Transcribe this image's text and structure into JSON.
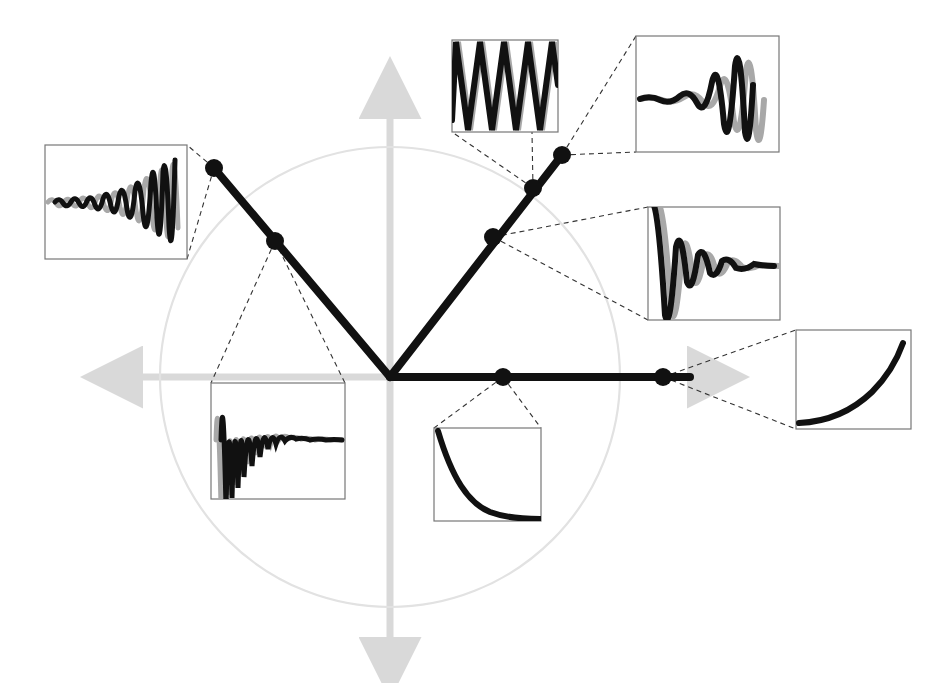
{
  "figure": {
    "width": 950,
    "height": 683,
    "background_color": "#ffffff"
  },
  "colors": {
    "axis": "#d9d9d9",
    "circle": "#e2e2e2",
    "ray": "#111111",
    "marker": "#111111",
    "leader": "#333333",
    "inset_border": "#777777",
    "curve_primary": "#111111",
    "curve_secondary": "#a8a8a8"
  },
  "geometry": {
    "origin": {
      "x": 390,
      "y": 377
    },
    "unit_circle_radius": 230,
    "axes": {
      "horizontal": {
        "x1": 128,
        "y1": 377,
        "x2": 700,
        "y2": 377,
        "arrows": "both"
      },
      "vertical": {
        "x1": 390,
        "y1": 105,
        "x2": 390,
        "y2": 650,
        "arrows": "both"
      }
    }
  },
  "chart_data": {
    "type": "scatter",
    "xlabel": "Real axis",
    "ylabel": "Imaginary axis",
    "grid": false,
    "legend": "none",
    "unit_circle_radius": 1.0,
    "rays": [
      {
        "name": "upper-left-ray",
        "angle_deg": 130,
        "description": "Ray into the second quadrant (unstable oscillatory region)",
        "end": {
          "x": 214,
          "y": 168
        }
      },
      {
        "name": "upper-right-ray",
        "angle_deg": 50,
        "description": "Ray into the first quadrant (growing oscillation region)",
        "end": {
          "x": 562,
          "y": 155
        }
      },
      {
        "name": "positive-real-ray",
        "angle_deg": 0,
        "description": "Ray along the positive real axis (non-oscillatory region)",
        "end": {
          "x": 690,
          "y": 377
        }
      }
    ],
    "points": [
      {
        "id": "p1",
        "label": "growing-oscillation-upper-left",
        "x": 214,
        "y": 168,
        "radius_norm": 1.24,
        "angle_deg": 130.6
      },
      {
        "id": "p2",
        "label": "damped-fast-oscillation",
        "x": 275,
        "y": 241,
        "radius_norm": 0.8,
        "angle_deg": 130.6
      },
      {
        "id": "p3",
        "label": "damped-oscillation",
        "x": 493,
        "y": 237,
        "radius_norm": 0.8,
        "angle_deg": 50.3
      },
      {
        "id": "p4",
        "label": "undamped-oscillation",
        "x": 533,
        "y": 188,
        "radius_norm": 1.0,
        "angle_deg": 50.3
      },
      {
        "id": "p5",
        "label": "growing-oscillation-upper-right",
        "x": 562,
        "y": 155,
        "radius_norm": 1.18,
        "angle_deg": 50.3
      },
      {
        "id": "p6",
        "label": "exponential-decay",
        "x": 503,
        "y": 377,
        "radius_norm": 0.49,
        "angle_deg": 0
      },
      {
        "id": "p7",
        "label": "exponential-growth",
        "x": 663,
        "y": 377,
        "radius_norm": 1.19,
        "angle_deg": 0
      }
    ]
  },
  "insets": [
    {
      "id": "inset-growing-oscillation-left",
      "name": "inset-growing-oscillation-left",
      "box": {
        "x": 45,
        "y": 145,
        "w": 142,
        "h": 114
      },
      "anchor_point": "p1",
      "waveform": {
        "kind": "growing-oscillation",
        "curves": 2,
        "envelope": "exponential-growth",
        "frequency": "high",
        "description": "Two phase-shifted sinusoids with exponentially growing amplitude"
      }
    },
    {
      "id": "inset-damped-fast-oscillation",
      "name": "inset-damped-fast-oscillation",
      "box": {
        "x": 211,
        "y": 383,
        "w": 134,
        "h": 116
      },
      "anchor_point": "p2",
      "waveform": {
        "kind": "damped-oscillation",
        "curves": 2,
        "envelope": "exponential-decay",
        "frequency": "high",
        "description": "Two phase-shifted sinusoids with rapidly decaying amplitude"
      }
    },
    {
      "id": "inset-undamped-oscillation",
      "name": "inset-undamped-oscillation",
      "box": {
        "x": 452,
        "y": 40,
        "w": 106,
        "h": 92
      },
      "anchor_point": "p4",
      "waveform": {
        "kind": "sustained-oscillation",
        "curves": 2,
        "envelope": "constant",
        "frequency": "medium",
        "description": "Two phase-shifted sinusoids of constant amplitude"
      }
    },
    {
      "id": "inset-growing-oscillation-right",
      "name": "inset-growing-oscillation-right",
      "box": {
        "x": 636,
        "y": 36,
        "w": 143,
        "h": 116
      },
      "anchor_point": "p5",
      "waveform": {
        "kind": "growing-oscillation",
        "curves": 2,
        "envelope": "exponential-growth",
        "frequency": "low",
        "description": "Two phase-shifted sinusoids with slowly growing amplitude"
      }
    },
    {
      "id": "inset-damped-oscillation",
      "name": "inset-damped-oscillation",
      "box": {
        "x": 648,
        "y": 207,
        "w": 132,
        "h": 113
      },
      "anchor_point": "p3",
      "waveform": {
        "kind": "damped-oscillation",
        "curves": 2,
        "envelope": "exponential-decay",
        "frequency": "low",
        "description": "Two phase-shifted sinusoids settling to a steady value"
      }
    },
    {
      "id": "inset-exponential-decay",
      "name": "inset-exponential-decay",
      "box": {
        "x": 434,
        "y": 428,
        "w": 107,
        "h": 93
      },
      "anchor_point": "p6",
      "waveform": {
        "kind": "exponential-decay",
        "curves": 1,
        "envelope": "exponential-decay",
        "frequency": "none",
        "description": "Single monotonically decaying exponential curve"
      }
    },
    {
      "id": "inset-exponential-growth",
      "name": "inset-exponential-growth",
      "box": {
        "x": 796,
        "y": 330,
        "w": 115,
        "h": 99
      },
      "anchor_point": "p7",
      "waveform": {
        "kind": "exponential-growth",
        "curves": 1,
        "envelope": "exponential-growth",
        "frequency": "none",
        "description": "Single monotonically growing exponential curve"
      }
    }
  ]
}
